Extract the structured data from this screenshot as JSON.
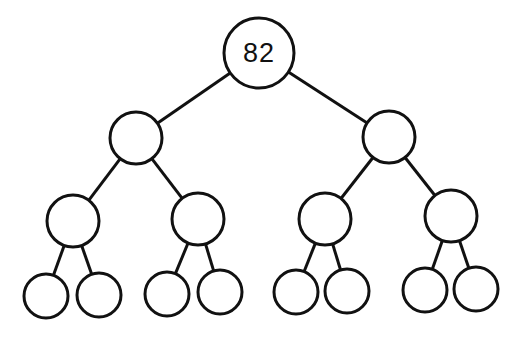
{
  "diagram": {
    "type": "binary-tree",
    "levels": 4,
    "colors": {
      "stroke": "#111111",
      "fill": "#ffffff",
      "background": "#ffffff"
    },
    "nodes": [
      {
        "id": "root",
        "label": "82",
        "cx": 259,
        "cy": 53,
        "r": 35
      },
      {
        "id": "n1",
        "label": "",
        "cx": 136,
        "cy": 138,
        "r": 26
      },
      {
        "id": "n2",
        "label": "",
        "cx": 389,
        "cy": 137,
        "r": 26
      },
      {
        "id": "n3",
        "label": "",
        "cx": 73,
        "cy": 221,
        "r": 26
      },
      {
        "id": "n4",
        "label": "",
        "cx": 198,
        "cy": 219,
        "r": 26
      },
      {
        "id": "n5",
        "label": "",
        "cx": 325,
        "cy": 219,
        "r": 26
      },
      {
        "id": "n6",
        "label": "",
        "cx": 451,
        "cy": 216,
        "r": 26
      },
      {
        "id": "n7",
        "label": "",
        "cx": 46,
        "cy": 296,
        "r": 22
      },
      {
        "id": "n8",
        "label": "",
        "cx": 99,
        "cy": 295,
        "r": 22
      },
      {
        "id": "n9",
        "label": "",
        "cx": 167,
        "cy": 294,
        "r": 22
      },
      {
        "id": "n10",
        "label": "",
        "cx": 220,
        "cy": 292,
        "r": 22
      },
      {
        "id": "n11",
        "label": "",
        "cx": 296,
        "cy": 292,
        "r": 22
      },
      {
        "id": "n12",
        "label": "",
        "cx": 347,
        "cy": 291,
        "r": 22
      },
      {
        "id": "n13",
        "label": "",
        "cx": 425,
        "cy": 290,
        "r": 22
      },
      {
        "id": "n14",
        "label": "",
        "cx": 476,
        "cy": 289,
        "r": 22
      }
    ],
    "edges": [
      [
        "root",
        "n1"
      ],
      [
        "root",
        "n2"
      ],
      [
        "n1",
        "n3"
      ],
      [
        "n1",
        "n4"
      ],
      [
        "n2",
        "n5"
      ],
      [
        "n2",
        "n6"
      ],
      [
        "n3",
        "n7"
      ],
      [
        "n3",
        "n8"
      ],
      [
        "n4",
        "n9"
      ],
      [
        "n4",
        "n10"
      ],
      [
        "n5",
        "n11"
      ],
      [
        "n5",
        "n12"
      ],
      [
        "n6",
        "n13"
      ],
      [
        "n6",
        "n14"
      ]
    ]
  }
}
